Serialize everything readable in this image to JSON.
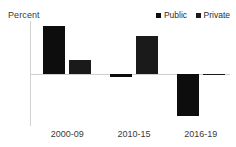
{
  "chart_data": {
    "type": "bar",
    "title": "",
    "subtitle": "",
    "unit_label": "Percent",
    "xlabel": "",
    "ylabel": "Percent",
    "categories": [
      "2000-09",
      "2010-15",
      "2016-19"
    ],
    "series": [
      {
        "name": "Public",
        "values": [
          7.3,
          -0.5,
          -6.5
        ],
        "color": "#0d0d0d"
      },
      {
        "name": "Private",
        "values": [
          2.0,
          5.7,
          -0.3
        ],
        "color": "#1a1a1a"
      }
    ],
    "yticks": [
      8,
      4,
      0,
      -4,
      -8
    ],
    "ytick_labels": [
      "8",
      "4",
      "0",
      "-4",
      "-8"
    ],
    "ylim": [
      -8,
      8
    ],
    "grid": false,
    "zero_line": true,
    "legend": {
      "position": "top-right",
      "entries": [
        "Public",
        "Private"
      ]
    }
  },
  "legend": {
    "public_label": "Public",
    "private_label": "Private"
  },
  "axis": {
    "unit": "Percent",
    "tick_8": "8",
    "tick_4": "4",
    "tick_0": "0",
    "tick_neg4": "-4",
    "tick_neg8": "-8"
  },
  "categories": {
    "cat0": "2000-09",
    "cat1": "2010-15",
    "cat2": "2016-19"
  },
  "colors": {
    "public": "#0d0d0d",
    "private": "#1a1a1a",
    "axis": "#d2d2d2",
    "text": "#3a3a3a",
    "background": "#ffffff"
  }
}
